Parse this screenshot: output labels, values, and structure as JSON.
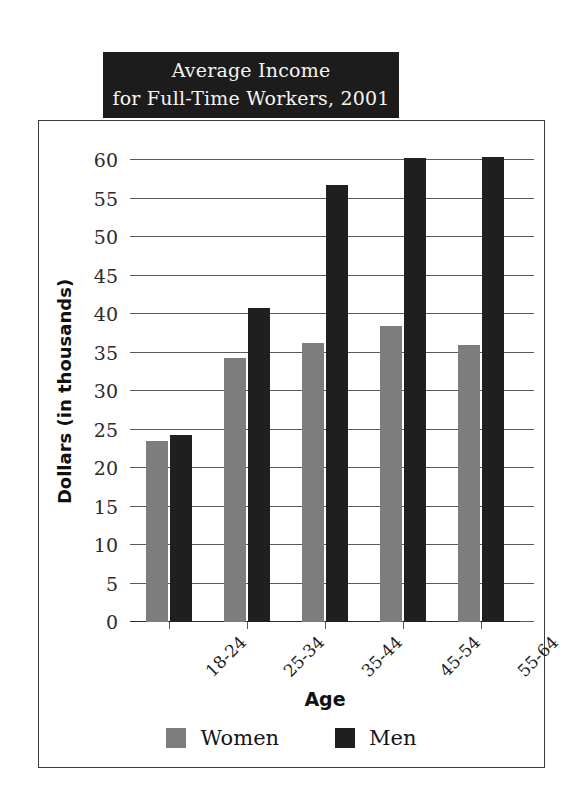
{
  "title": {
    "line1": "Average Income",
    "line2": "for Full-Time Workers, 2001"
  },
  "legend": {
    "items": [
      {
        "label": "Women",
        "color": "#7d7d7d"
      },
      {
        "label": "Men",
        "color": "#1f1f1f"
      }
    ]
  },
  "axes": {
    "x_title": "Age",
    "y_title": "Dollars (in thousands)",
    "y_ticks": [
      "0",
      "5",
      "10",
      "15",
      "20",
      "25",
      "30",
      "35",
      "40",
      "45",
      "50",
      "55",
      "60"
    ]
  },
  "chart_data": {
    "type": "bar",
    "title": "Average Income for Full-Time Workers, 2001",
    "xlabel": "Age",
    "ylabel": "Dollars (in thousands)",
    "categories": [
      "18-24",
      "25-34",
      "35-44",
      "45-54",
      "55-64"
    ],
    "series": [
      {
        "name": "Women",
        "color": "#7d7d7d",
        "values": [
          23.5,
          34.3,
          36.3,
          38.4,
          36.0
        ]
      },
      {
        "name": "Men",
        "color": "#1f1f1f",
        "values": [
          24.3,
          40.8,
          56.8,
          60.2,
          60.4
        ]
      }
    ],
    "ylim": [
      0,
      60
    ],
    "ytick_step": 5,
    "grid": true,
    "legend_position": "bottom"
  }
}
